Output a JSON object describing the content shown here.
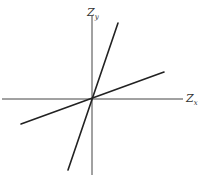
{
  "diagram": {
    "axes": {
      "vertical": {
        "label": "Z",
        "subscript": "y"
      },
      "horizontal": {
        "label": "Z",
        "subscript": "x"
      }
    },
    "lines": [
      {
        "name": "steep-line",
        "description": "steep line through origin"
      },
      {
        "name": "shallow-line",
        "description": "shallow line through origin"
      }
    ],
    "colors": {
      "axis": "#444444",
      "line": "#222222",
      "background": "#ffffff"
    }
  }
}
